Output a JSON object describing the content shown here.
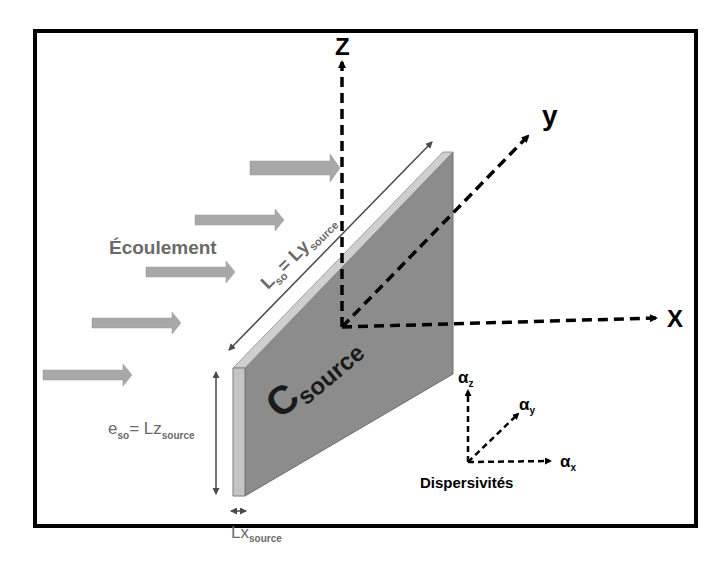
{
  "diagram": {
    "axes": {
      "z_label": "Z",
      "y_label": "y",
      "x_label": "X"
    },
    "flow_label": "Écoulement",
    "source": {
      "main": "C",
      "sub": "source"
    },
    "length_label": {
      "main": "L",
      "sub1": "so",
      "eq": "= Ly",
      "sub2": "source"
    },
    "thickness_label": {
      "main": "e",
      "sub1": "so",
      "eq": "= Lz",
      "sub2": "source"
    },
    "width_label": {
      "main": "Lx",
      "sub": "source"
    },
    "dispersivities": {
      "title": "Dispersivités",
      "alpha": "α",
      "z": "z",
      "y": "y",
      "x": "x"
    },
    "colors": {
      "frame": "#000000",
      "arrow_fill": "#a8a8a8",
      "slab_face": "#8c8c8c",
      "slab_edge": "#c8c8c8",
      "dim_line": "#4a4a4a",
      "text_gray": "#6a6a6a"
    }
  }
}
